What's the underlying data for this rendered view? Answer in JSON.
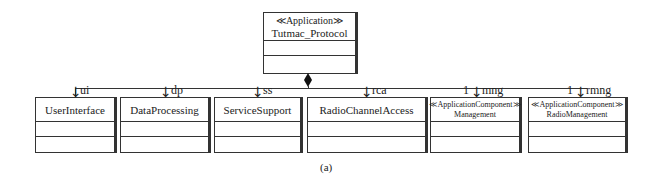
{
  "root": {
    "stereotype": "≪Application≫",
    "name": "Tutmac_Protocol"
  },
  "parts": [
    {
      "role": "ui",
      "multiplicity": "",
      "stereotype": "",
      "name": "UserInterface"
    },
    {
      "role": "dp",
      "multiplicity": "",
      "stereotype": "",
      "name": "DataProcessing"
    },
    {
      "role": "ss",
      "multiplicity": "",
      "stereotype": "",
      "name": "ServiceSupport"
    },
    {
      "role": "rca",
      "multiplicity": "",
      "stereotype": "",
      "name": "RadioChannelAccess"
    },
    {
      "role": "mng",
      "multiplicity": "1",
      "stereotype": "≪ApplicationComponent≫",
      "name": "Management"
    },
    {
      "role": "rmng",
      "multiplicity": "1",
      "stereotype": "≪ApplicationComponent≫",
      "name": "RadioManagement"
    }
  ],
  "caption": "(a)"
}
